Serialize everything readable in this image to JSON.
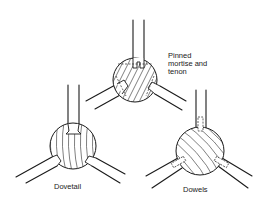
{
  "joints": [
    {
      "id": "pinned-mortise-and-tenon",
      "label": "Pinned\nmortise and\ntenon",
      "center": [
        135,
        80
      ],
      "radius": 22
    },
    {
      "id": "dovetail",
      "label": "Dovetail",
      "center": [
        73,
        146
      ],
      "radius": 23
    },
    {
      "id": "dowels",
      "label": "Dowels",
      "center": [
        200,
        151
      ],
      "radius": 24
    }
  ],
  "colors": {
    "ink": "#1a1a1a",
    "background": "#ffffff"
  }
}
